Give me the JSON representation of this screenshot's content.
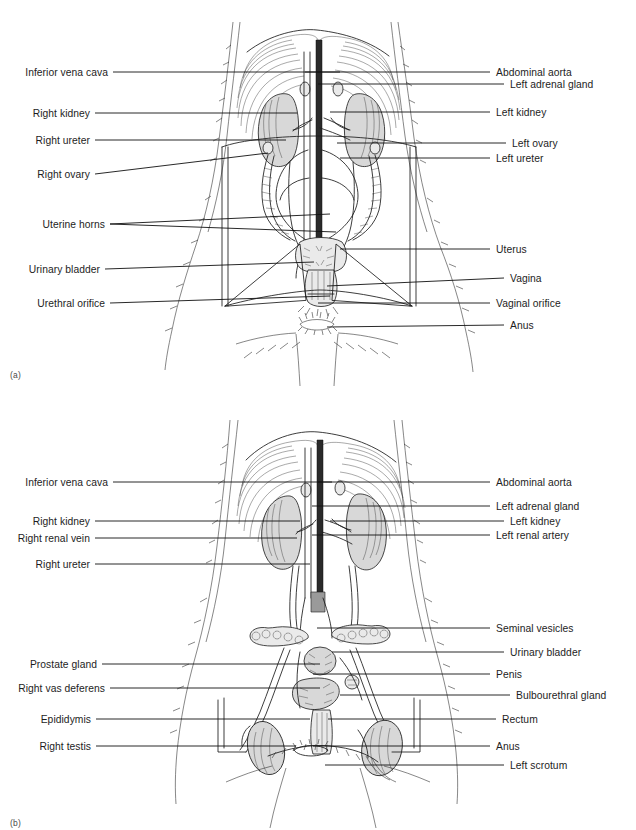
{
  "document": {
    "type": "anatomy-plate",
    "title": "Urogenital systems of the dog",
    "background_color": "#ffffff",
    "ink_color": "#1a1a1a"
  },
  "figures": [
    {
      "id": "a",
      "caption": "(a)",
      "subject": "female urogenital system, ventral view",
      "labels_left": [
        {
          "text": "Inferior vena cava",
          "y": 72,
          "x_end": 340
        },
        {
          "text": "Right kidney",
          "y": 113,
          "x_end": 297
        },
        {
          "text": "Right ureter",
          "y": 140,
          "x_end": 286
        },
        {
          "text": "Right ovary",
          "y": 174,
          "x_end": 268
        },
        {
          "text": "Uterine horns",
          "y": 224,
          "x_end": 330
        },
        {
          "text": "Urinary bladder",
          "y": 269,
          "x_end": 314
        },
        {
          "text": "Urethral orifice",
          "y": 303,
          "x_end": 330
        }
      ],
      "labels_right": [
        {
          "text": "Abdominal aorta",
          "y": 72,
          "x_start": 305
        },
        {
          "text": "Left adrenal gland",
          "y": 84,
          "x_start": 318
        },
        {
          "text": "Left kidney",
          "y": 112,
          "x_start": 330
        },
        {
          "text": "Left ovary",
          "y": 143,
          "x_start": 337
        },
        {
          "text": "Left ureter",
          "y": 158,
          "x_start": 340
        },
        {
          "text": "Uterus",
          "y": 249,
          "x_start": 340
        },
        {
          "text": "Vagina",
          "y": 278,
          "x_start": 327
        },
        {
          "text": "Vaginal orifice",
          "y": 303,
          "x_start": 318
        },
        {
          "text": "Anus",
          "y": 325,
          "x_start": 327
        }
      ]
    },
    {
      "id": "b",
      "caption": "(b)",
      "subject": "male urogenital system, ventral view",
      "labels_left": [
        {
          "text": "Inferior vena cava",
          "y": 482,
          "x_end": 332
        },
        {
          "text": "Right kidney",
          "y": 521,
          "x_end": 300
        },
        {
          "text": "Right renal vein",
          "y": 538,
          "x_end": 297
        },
        {
          "text": "Right ureter",
          "y": 564,
          "x_end": 310
        },
        {
          "text": "Prostate gland",
          "y": 664,
          "x_end": 320
        },
        {
          "text": "Right vas deferens",
          "y": 688,
          "x_end": 320
        },
        {
          "text": "Epididymis",
          "y": 719,
          "x_end": 310
        },
        {
          "text": "Right testis",
          "y": 746,
          "x_end": 296
        }
      ],
      "labels_right": [
        {
          "text": "Abdominal aorta",
          "y": 482,
          "x_start": 318
        },
        {
          "text": "Left adrenal gland",
          "y": 506,
          "x_start": 312
        },
        {
          "text": "Left kidney",
          "y": 521,
          "x_start": 330
        },
        {
          "text": "Left renal artery",
          "y": 535,
          "x_start": 312
        },
        {
          "text": "Seminal vesicles",
          "y": 628,
          "x_start": 317
        },
        {
          "text": "Urinary bladder",
          "y": 652,
          "x_start": 332
        },
        {
          "text": "Penis",
          "y": 674,
          "x_start": 313
        },
        {
          "text": "Bulbourethral gland",
          "y": 695,
          "x_start": 340
        },
        {
          "text": "Rectum",
          "y": 719,
          "x_start": 328
        },
        {
          "text": "Anus",
          "y": 746,
          "x_start": 313
        },
        {
          "text": "Left scrotum",
          "y": 765,
          "x_start": 325
        }
      ]
    }
  ]
}
